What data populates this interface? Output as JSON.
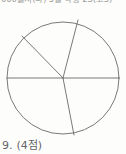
{
  "page": {
    "background_color": "#fdfdfc",
    "ink_color": "#5a5a5c"
  },
  "header": {
    "clipped_text": "000물지(나) 5월 학평 23(고3)"
  },
  "figure": {
    "name": "circle-divided-into-sectors",
    "shape": "circle",
    "center_x": 63,
    "center_y": 78,
    "radius": 56,
    "stroke_color": "#6a6a6c",
    "stroke_width": 0.9,
    "radii_count": 4,
    "sector_count": 5,
    "radii_angles_deg": [
      0,
      74.6,
      134.3,
      180,
      281.1
    ],
    "radii_endpoints": [
      {
        "label": "right",
        "x": 119,
        "y": 78
      },
      {
        "label": "upper-right",
        "x": 78,
        "y": 20
      },
      {
        "label": "upper-left",
        "x": 22,
        "y": 36
      },
      {
        "label": "left",
        "x": 7,
        "y": 78
      },
      {
        "label": "lower-right",
        "x": 74,
        "y": 135
      }
    ]
  },
  "question": {
    "number": "9.",
    "points": "(4점)"
  },
  "chart_data": {
    "type": "pie",
    "title": "",
    "categories": [
      "sector-1",
      "sector-2",
      "sector-3",
      "sector-4",
      "sector-5"
    ],
    "values": [
      74.6,
      59.7,
      45.7,
      101.1,
      78.9
    ],
    "unit": "degrees",
    "legend": "none",
    "labels_shown": false
  }
}
